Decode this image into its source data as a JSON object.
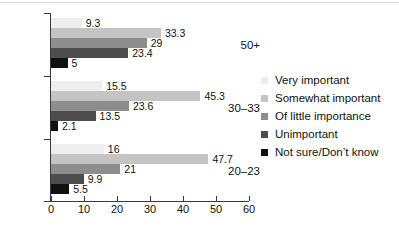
{
  "chart_data": {
    "type": "bar",
    "orientation": "horizontal",
    "title": "",
    "xlabel": "",
    "ylabel": "",
    "xlim": [
      0,
      60
    ],
    "xticks": [
      0,
      10,
      20,
      30,
      40,
      50,
      60
    ],
    "grid": false,
    "legend_position": "right",
    "categories": [
      "50+",
      "30–33",
      "20–23"
    ],
    "series": [
      {
        "name": "Very important",
        "color": "#eeeeee",
        "values": [
          9.3,
          15.5,
          16
        ]
      },
      {
        "name": "Somewhat important",
        "color": "#c4c4c4",
        "values": [
          33.3,
          45.3,
          47.7
        ]
      },
      {
        "name": "Of little importance",
        "color": "#8d8d8d",
        "values": [
          29,
          23.6,
          21
        ]
      },
      {
        "name": "Unimportant",
        "color": "#4d4d4d",
        "values": [
          23.4,
          13.5,
          9.9
        ]
      },
      {
        "name": "Not sure/Don’t know",
        "color": "#111111",
        "values": [
          5,
          2.1,
          5.5
        ]
      }
    ],
    "value_labels": {
      "50+": [
        "9.3",
        "33.3",
        "29",
        "23.4",
        "5"
      ],
      "30–33": [
        "15.5",
        "45.3",
        "23.6",
        "13.5",
        "2.1"
      ],
      "20–23": [
        "16",
        "47.7",
        "21",
        "9.9",
        "5.5"
      ]
    }
  },
  "legend": {
    "items": [
      {
        "label": "Very important",
        "color": "#eeeeee"
      },
      {
        "label": "Somewhat important",
        "color": "#c4c4c4"
      },
      {
        "label": "Of little importance",
        "color": "#8d8d8d"
      },
      {
        "label": "Unimportant",
        "color": "#4d4d4d"
      },
      {
        "label": "Not sure/Don’t know",
        "color": "#111111"
      }
    ]
  },
  "axis": {
    "x_tick_labels": [
      "0",
      "10",
      "20",
      "30",
      "40",
      "50",
      "60"
    ],
    "y_tick_labels": [
      "50+",
      "30–33",
      "20–23"
    ]
  }
}
